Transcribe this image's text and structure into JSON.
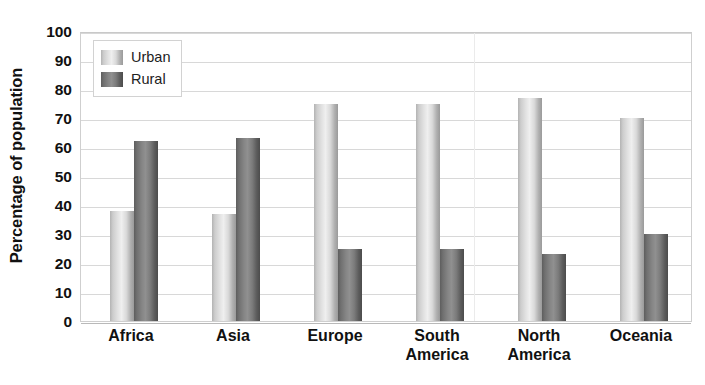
{
  "chart_data": {
    "type": "bar",
    "title": "",
    "subtitle": "",
    "xlabel": "",
    "ylabel": "Percentage of population",
    "ylim": [
      0,
      100
    ],
    "ytick_step": 10,
    "yticks": [
      100,
      90,
      80,
      70,
      60,
      50,
      40,
      30,
      20,
      10,
      0
    ],
    "grid": true,
    "grid_axis": "y",
    "legend_position": "top-left-inside",
    "categories": [
      "Africa",
      "Asia",
      "Europe",
      "South\nAmerica",
      "North\nAmerica",
      "Oceania"
    ],
    "series": [
      {
        "name": "Urban",
        "color": "#dcdcdc",
        "values": [
          38,
          37,
          75,
          75,
          77,
          70
        ]
      },
      {
        "name": "Rural",
        "color": "#787878",
        "values": [
          62,
          63,
          25,
          25,
          23,
          30
        ]
      }
    ]
  },
  "legend": {
    "entries": [
      {
        "label": "Urban",
        "swatch": "urban"
      },
      {
        "label": "Rural",
        "swatch": "rural"
      }
    ]
  },
  "colors": {
    "urban_light": "#efefef",
    "urban_dark": "#9a9a9a",
    "rural_light": "#909090",
    "rural_dark": "#4c4c4c",
    "gridline": "#d8d8d8",
    "axis_border": "#cfcfcf",
    "text": "#111111",
    "background": "#ffffff"
  }
}
